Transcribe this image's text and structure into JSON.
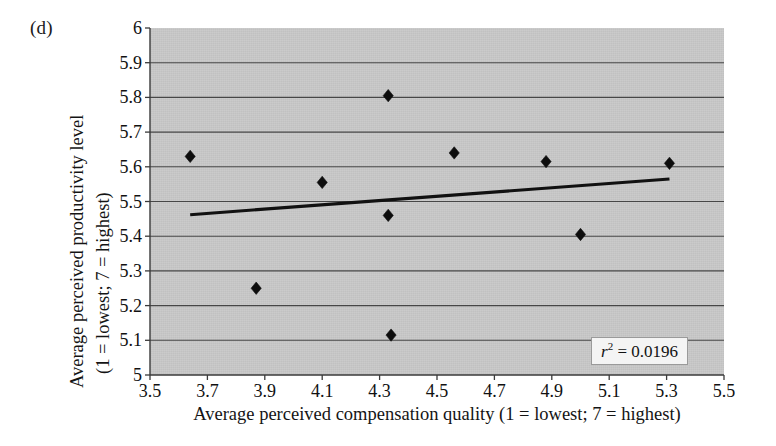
{
  "panel": {
    "label": "(d)"
  },
  "chart_data": {
    "type": "scatter",
    "title": "",
    "subtitle": "",
    "panel_label": "(d)",
    "xlabel": "Average perceived compensation quality (1 = lowest; 7 = highest)",
    "ylabel_line1": "Average perceived productivity level",
    "ylabel_line2": "(1 = lowest; 7 = highest)",
    "xlim": [
      3.5,
      5.5
    ],
    "ylim": [
      5,
      6
    ],
    "xticks": [
      3.5,
      3.7,
      3.9,
      4.1,
      4.3,
      4.5,
      4.7,
      4.9,
      5.1,
      5.3,
      5.5
    ],
    "yticks": [
      5,
      5.1,
      5.2,
      5.3,
      5.4,
      5.5,
      5.6,
      5.7,
      5.8,
      5.9,
      6
    ],
    "xtick_labels": [
      "3.5",
      "3.7",
      "3.9",
      "4.1",
      "4.3",
      "4.5",
      "4.7",
      "4.9",
      "5.1",
      "5.3",
      "5.5"
    ],
    "ytick_labels": [
      "5",
      "5.1",
      "5.2",
      "5.3",
      "5.4",
      "5.5",
      "5.6",
      "5.7",
      "5.8",
      "5.9",
      "6"
    ],
    "grid": "horizontal",
    "legend": "none",
    "plot_background": "#c9c9c9",
    "marker": "diamond",
    "marker_color": "#0d0d0d",
    "points": [
      {
        "x": 3.64,
        "y": 5.63
      },
      {
        "x": 3.87,
        "y": 5.25
      },
      {
        "x": 4.1,
        "y": 5.555
      },
      {
        "x": 4.33,
        "y": 5.805
      },
      {
        "x": 4.33,
        "y": 5.46
      },
      {
        "x": 4.34,
        "y": 5.115
      },
      {
        "x": 4.56,
        "y": 5.64
      },
      {
        "x": 4.88,
        "y": 5.615
      },
      {
        "x": 5.0,
        "y": 5.405
      },
      {
        "x": 5.31,
        "y": 5.61
      }
    ],
    "trendline": {
      "x_start": 3.64,
      "y_start": 5.462,
      "x_end": 5.31,
      "y_end": 5.565,
      "color": "#111111"
    },
    "annotation": {
      "text": "r2 = 0.0196",
      "r_symbol": "r",
      "exponent": "2",
      "equals_value": " = 0.0196"
    }
  }
}
